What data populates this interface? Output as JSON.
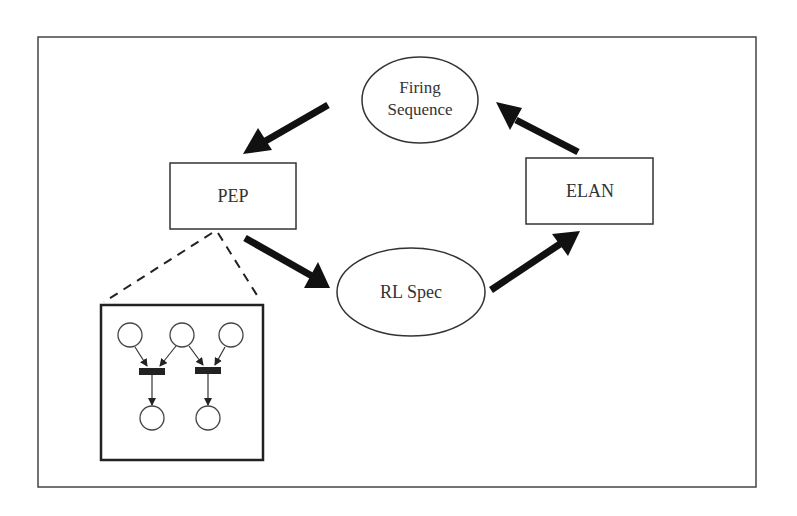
{
  "diagram": {
    "nodes": {
      "firing_sequence": {
        "line1": "Firing",
        "line2": "Sequence",
        "shape": "ellipse"
      },
      "pep": {
        "label": "PEP",
        "shape": "rectangle"
      },
      "elan": {
        "label": "ELAN",
        "shape": "rectangle"
      },
      "rl_spec": {
        "label": "RL Spec",
        "shape": "ellipse"
      }
    },
    "edges": [
      {
        "from": "Firing Sequence",
        "to": "PEP"
      },
      {
        "from": "PEP",
        "to": "RL Spec"
      },
      {
        "from": "RL Spec",
        "to": "ELAN"
      },
      {
        "from": "ELAN",
        "to": "Firing Sequence"
      }
    ],
    "inset": {
      "description": "Petri net detail of PEP",
      "places": 5,
      "transitions": 2
    },
    "colors": {
      "stroke": "#333333",
      "arrow": "#111111",
      "background": "#ffffff"
    }
  }
}
